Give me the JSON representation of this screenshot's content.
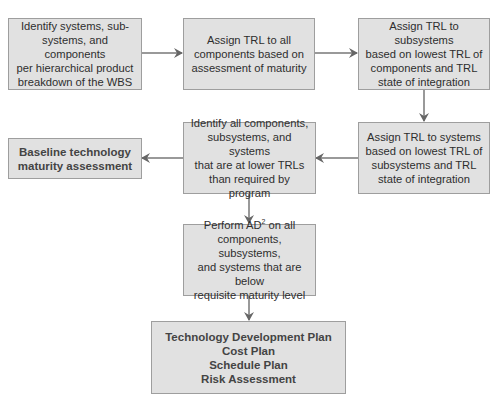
{
  "diagram": {
    "type": "flowchart",
    "colors": {
      "box_fill": "#e1e1e1",
      "box_border": "#9e9e9e",
      "arrow": "#666666",
      "text": "#2e2e2e"
    },
    "nodes": [
      {
        "id": "identify-wbs",
        "text": "Identify systems, sub-\nsystems, and components\nper hierarchical product\nbreakdown of the WBS"
      },
      {
        "id": "assign-trl-components",
        "text": "Assign TRL to all\ncomponents based on\nassessment of maturity"
      },
      {
        "id": "assign-trl-subsystems",
        "text": "Assign TRL to subsystems\nbased on lowest TRL of\ncomponents and TRL\nstate of integration"
      },
      {
        "id": "assign-trl-systems",
        "text": "Assign TRL to systems\nbased on lowest TRL of\nsubsystems and TRL\nstate of integration"
      },
      {
        "id": "identify-lower-trl",
        "text": "Identify all components,\nsubsystems, and systems\nthat are at lower TRLs\nthan required by program"
      },
      {
        "id": "baseline-assessment",
        "text": "Baseline technology\nmaturity assessment"
      },
      {
        "id": "perform-ad2",
        "text_before_sup": "Perform AD",
        "sup": "2",
        "text_after_sup": " on all\ncomponents, subsystems,\nand systems that are below\nrequisite maturity level"
      },
      {
        "id": "plans",
        "text": "Technology Development Plan\nCost Plan\nSchedule Plan\nRisk Assessment"
      }
    ],
    "edges": [
      {
        "from": "identify-wbs",
        "to": "assign-trl-components"
      },
      {
        "from": "assign-trl-components",
        "to": "assign-trl-subsystems"
      },
      {
        "from": "assign-trl-subsystems",
        "to": "assign-trl-systems"
      },
      {
        "from": "assign-trl-systems",
        "to": "identify-lower-trl"
      },
      {
        "from": "identify-lower-trl",
        "to": "baseline-assessment"
      },
      {
        "from": "identify-lower-trl",
        "to": "perform-ad2"
      },
      {
        "from": "perform-ad2",
        "to": "plans"
      }
    ]
  }
}
